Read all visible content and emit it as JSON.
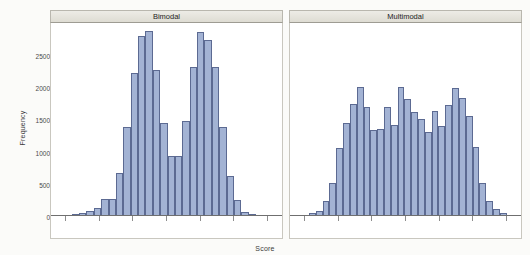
{
  "chart_data": {
    "type": "bar",
    "title": "",
    "xlabel": "Score",
    "ylabel": "Frequency",
    "ylim": [
      0,
      2950
    ],
    "yticks": [
      0,
      500,
      1000,
      1500,
      2000,
      2500
    ],
    "ytick_labels": [
      "0",
      "500",
      "1000",
      "1500",
      "2000",
      "2500"
    ],
    "xtick_labels": [],
    "grid": false,
    "legend": null,
    "panels": [
      {
        "label": "Bimodal",
        "values": [
          10,
          10,
          15,
          25,
          40,
          75,
          130,
          265,
          270,
          665,
          1375,
          2225,
          2800,
          2870,
          2270,
          1450,
          930,
          930,
          1475,
          2320,
          2850,
          2730,
          2320,
          1385,
          620,
          245,
          70,
          25,
          15,
          12,
          10,
          8
        ]
      },
      {
        "label": "Multimodal",
        "values": [
          10,
          12,
          18,
          40,
          85,
          230,
          520,
          1050,
          1450,
          1740,
          2000,
          1700,
          1340,
          1345,
          1700,
          1415,
          2010,
          1820,
          1620,
          1500,
          1310,
          1625,
          1395,
          1725,
          1990,
          1835,
          1560,
          1075,
          520,
          230,
          110,
          40,
          18,
          12
        ]
      }
    ]
  },
  "axes": {
    "y_title": "Frequency",
    "x_title": "Score"
  },
  "colors": {
    "bar_fill": "#a3b3d4",
    "bar_border": "#5c6a92",
    "strip_background": "#e3e1da",
    "panel_background": "#ffffff",
    "page_background": "#fbfbf9",
    "axis": "#6f6f6f",
    "text": "#3a3a3a"
  }
}
